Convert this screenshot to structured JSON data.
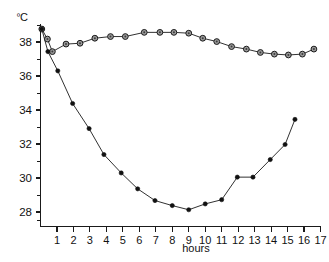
{
  "chart_data": {
    "type": "line",
    "title": "",
    "subtitle": "",
    "xlabel": "hours",
    "ylabel": "ºC",
    "ylabel_unit_degree": "º",
    "ylabel_unit_letter": "C",
    "xlim": [
      0,
      17
    ],
    "ylim": [
      27.2,
      39.3
    ],
    "grid": false,
    "legend": "none",
    "y_ticks": [
      28,
      30,
      32,
      34,
      36,
      38
    ],
    "y_tick_labels": [
      "28",
      "30",
      "32",
      "34",
      "36",
      "38"
    ],
    "y_minor_ticks": [
      27.5,
      29,
      31,
      33,
      35,
      37,
      39
    ],
    "x_ticks": [
      1,
      2,
      3,
      4,
      5,
      6,
      7,
      8,
      9,
      10,
      11,
      12,
      13,
      14,
      15,
      16,
      17
    ],
    "x_tick_labels": [
      "1",
      "2",
      "3",
      "4",
      "5",
      "6",
      "7",
      "8",
      "9",
      "10",
      "11",
      "12",
      "13",
      "14",
      "15",
      "16",
      "17"
    ],
    "series": [
      {
        "name": "upper-curve",
        "marker": "open-circle",
        "x": [
          0.08,
          0.42,
          0.72,
          1.55,
          2.4,
          3.3,
          4.25,
          5.15,
          6.3,
          7.25,
          8.1,
          9.0,
          9.85,
          10.7,
          11.6,
          12.5,
          13.35,
          14.2,
          15.05,
          15.9,
          16.6
        ],
        "values": [
          39.0,
          38.4,
          37.65,
          38.1,
          38.15,
          38.45,
          38.55,
          38.55,
          38.8,
          38.8,
          38.8,
          38.75,
          38.45,
          38.25,
          37.95,
          37.8,
          37.6,
          37.5,
          37.45,
          37.5,
          37.8
        ]
      },
      {
        "name": "lower-curve",
        "marker": "filled-circle",
        "x": [
          0.08,
          0.45,
          1.05,
          1.95,
          2.95,
          3.85,
          4.9,
          5.9,
          6.95,
          8.0,
          9.0,
          10.0,
          11.0,
          11.95,
          12.9,
          13.95,
          14.85,
          15.45
        ],
        "values": [
          39.0,
          37.65,
          36.5,
          34.55,
          33.05,
          31.5,
          30.4,
          29.45,
          28.75,
          28.45,
          28.2,
          28.55,
          28.8,
          30.15,
          30.15,
          31.2,
          32.1,
          33.6
        ]
      }
    ]
  },
  "figure": {
    "background_color": "#ffffff",
    "axis_color": "#1a1a1a",
    "series_color": "#111111",
    "open_marker_fill": "#9a9a9a"
  }
}
